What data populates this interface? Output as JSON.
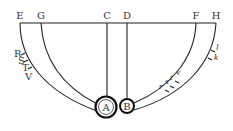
{
  "diagram": {
    "top_labels": {
      "E": "E",
      "G": "G",
      "C": "C",
      "D": "D",
      "F": "F",
      "H": "H"
    },
    "circles": {
      "A": "A",
      "B": "B"
    },
    "left_marks": [
      "R",
      "S",
      "T",
      "V"
    ],
    "right_inner_marks": [
      "r",
      "s",
      "t",
      "v"
    ],
    "right_outer_marks": [
      "l",
      "k"
    ]
  }
}
